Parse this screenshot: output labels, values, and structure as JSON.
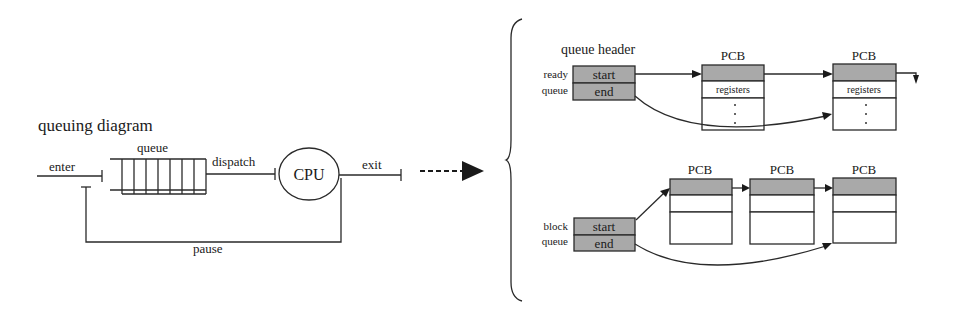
{
  "left": {
    "title": "queuing diagram",
    "queue_label": "queue",
    "enter_label": "enter",
    "dispatch_label": "dispatch",
    "cpu_label": "CPU",
    "exit_label": "exit",
    "pause_label": "pause",
    "queue_slots": 7
  },
  "right": {
    "header_title": "queue header",
    "ready_queue": {
      "label_line1": "ready",
      "label_line2": "queue",
      "start": "start",
      "end": "end",
      "pcbs": [
        {
          "title": "PCB",
          "row2": "registers",
          "ellipsis": "·"
        },
        {
          "title": "PCB",
          "row2": "registers",
          "ellipsis": "·"
        }
      ]
    },
    "block_queue": {
      "label_line1": "block",
      "label_line2": "queue",
      "start": "start",
      "end": "end",
      "pcbs": [
        {
          "title": "PCB"
        },
        {
          "title": "PCB"
        },
        {
          "title": "PCB"
        }
      ]
    }
  },
  "colors": {
    "header_fill": "#a9a9a9",
    "line": "#2a2a2a",
    "background": "#ffffff"
  }
}
